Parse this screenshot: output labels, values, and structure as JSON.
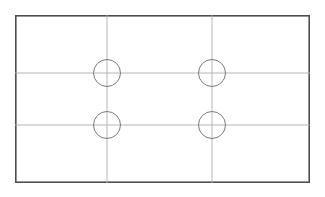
{
  "document": {
    "title": "Mounting Plate Outline Drawing",
    "type": "technical-drawing",
    "view": "plan-view",
    "background_color": "#ffffff"
  },
  "canvas": {
    "width": 325,
    "height": 197
  },
  "drawing": {
    "plate": {
      "name": "rectangular-plate-outline",
      "x": 15,
      "y": 15,
      "width": 295,
      "height": 168,
      "stroke_color": "#4f4f4f",
      "stroke_width": 1.6,
      "fill_color": "#ffffff"
    },
    "centerlines": {
      "stroke_color": "#aeaeae",
      "stroke_width": 0.9,
      "vertical": [
        {
          "name": "vertical-centerline-left",
          "x": 107,
          "y1": 15,
          "y2": 183
        },
        {
          "name": "vertical-centerline-right",
          "x": 212,
          "y1": 15,
          "y2": 183
        }
      ],
      "horizontal": [
        {
          "name": "horizontal-centerline-upper",
          "y": 73,
          "x1": 15,
          "x2": 310
        },
        {
          "name": "horizontal-centerline-lower",
          "y": 125,
          "x1": 15,
          "x2": 310
        }
      ]
    },
    "holes": {
      "count": 4,
      "radius": 13.5,
      "stroke_color": "#7a7a7a",
      "stroke_width": 1.0,
      "items": [
        {
          "name": "hole-top-left",
          "cx": 107,
          "cy": 73,
          "r": 13.5
        },
        {
          "name": "hole-top-right",
          "cx": 212,
          "cy": 73,
          "r": 13.5
        },
        {
          "name": "hole-bottom-left",
          "cx": 107,
          "cy": 125,
          "r": 13.5
        },
        {
          "name": "hole-bottom-right",
          "cx": 212,
          "cy": 125,
          "r": 13.5
        }
      ]
    }
  }
}
